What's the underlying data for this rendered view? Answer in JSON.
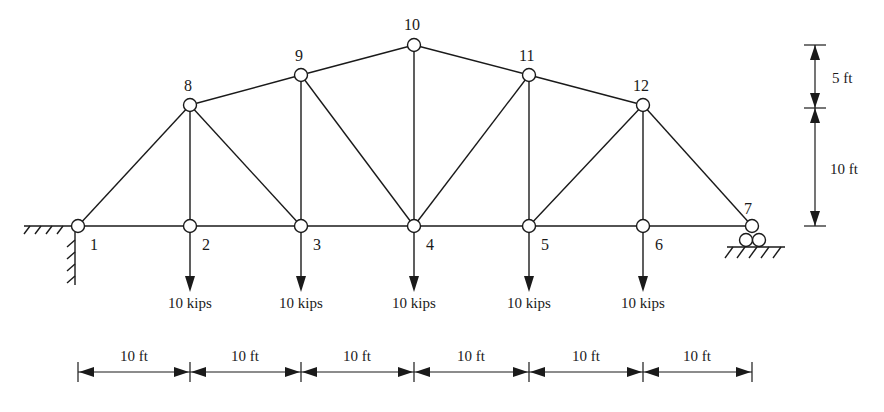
{
  "diagram": {
    "type": "truss",
    "nodes": [
      {
        "id": "1",
        "label": "1",
        "x": 78,
        "y": 226
      },
      {
        "id": "2",
        "label": "2",
        "x": 190,
        "y": 226
      },
      {
        "id": "3",
        "label": "3",
        "x": 301,
        "y": 226
      },
      {
        "id": "4",
        "label": "4",
        "x": 414,
        "y": 226
      },
      {
        "id": "5",
        "label": "5",
        "x": 529,
        "y": 226
      },
      {
        "id": "6",
        "label": "6",
        "x": 643,
        "y": 226
      },
      {
        "id": "7",
        "label": "7",
        "x": 752,
        "y": 226
      },
      {
        "id": "8",
        "label": "8",
        "x": 190,
        "y": 105
      },
      {
        "id": "9",
        "label": "9",
        "x": 301,
        "y": 75
      },
      {
        "id": "10",
        "label": "10",
        "x": 414,
        "y": 45
      },
      {
        "id": "11",
        "label": "11",
        "x": 529,
        "y": 75
      },
      {
        "id": "12",
        "label": "12",
        "x": 643,
        "y": 105
      }
    ],
    "members": [
      [
        "1",
        "2"
      ],
      [
        "2",
        "3"
      ],
      [
        "3",
        "4"
      ],
      [
        "4",
        "5"
      ],
      [
        "5",
        "6"
      ],
      [
        "6",
        "7"
      ],
      [
        "1",
        "8"
      ],
      [
        "8",
        "9"
      ],
      [
        "9",
        "10"
      ],
      [
        "10",
        "11"
      ],
      [
        "11",
        "12"
      ],
      [
        "12",
        "7"
      ],
      [
        "8",
        "2"
      ],
      [
        "9",
        "3"
      ],
      [
        "10",
        "4"
      ],
      [
        "11",
        "5"
      ],
      [
        "12",
        "6"
      ],
      [
        "8",
        "3"
      ],
      [
        "9",
        "4"
      ],
      [
        "11",
        "4"
      ],
      [
        "12",
        "5"
      ]
    ],
    "supports": {
      "left": {
        "node": "1",
        "type": "pin"
      },
      "right": {
        "node": "7",
        "type": "roller"
      }
    },
    "loads": [
      {
        "node": "2",
        "label": "10 kips"
      },
      {
        "node": "3",
        "label": "10 kips"
      },
      {
        "node": "4",
        "label": "10 kips"
      },
      {
        "node": "5",
        "label": "10 kips"
      },
      {
        "node": "6",
        "label": "10 kips"
      }
    ],
    "horizontal_dimensions": [
      "10 ft",
      "10 ft",
      "10 ft",
      "10 ft",
      "10 ft",
      "10 ft"
    ],
    "vertical_dimensions": {
      "upper": "5 ft",
      "lower": "10 ft"
    }
  }
}
